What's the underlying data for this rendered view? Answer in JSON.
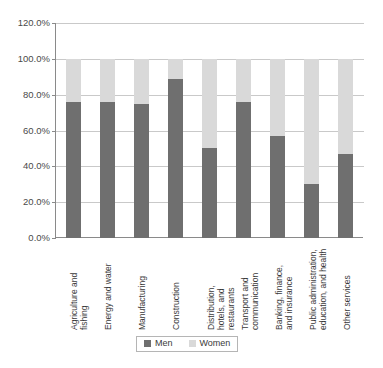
{
  "chart_data": {
    "type": "bar",
    "stacked": true,
    "orientation": "vertical",
    "title": "",
    "subtitle": "",
    "xlabel": "",
    "ylabel": "",
    "ylim": [
      0,
      120
    ],
    "ytick_step": 20,
    "ytick_labels": [
      "0.0%",
      "20.0%",
      "40.0%",
      "60.0%",
      "80.0%",
      "100.0%",
      "120.0%"
    ],
    "ytick_values": [
      0,
      20,
      40,
      60,
      80,
      100,
      120
    ],
    "grid": true,
    "grid_axis": "y",
    "legend_position": "bottom",
    "categories": [
      "Agriculture and fishing",
      "Energy and water",
      "Manufacturing",
      "Construction",
      "Distribution, hotels, and restaurants",
      "Transport and communication",
      "Banking, finance, and insurance",
      "Public administration, education, and health",
      "Other services"
    ],
    "category_label_lines": [
      "Agriculture and\nfishing",
      "Energy and water",
      "Manufacturing",
      "Construction",
      "Distribution,\nhotels, and\nrestaurants",
      "Transport and\ncommunication",
      "Banking, finance,\nand insurance",
      "Public administration,\neducation, and health",
      "Other services"
    ],
    "series": [
      {
        "name": "Men",
        "color": "#6f6f6f",
        "values": [
          76,
          76,
          75,
          89,
          50,
          76,
          57,
          30,
          47
        ]
      },
      {
        "name": "Women",
        "color": "#d9d9d9",
        "values": [
          24,
          24,
          25,
          11,
          50,
          24,
          43,
          70,
          53
        ]
      }
    ]
  },
  "legend": {
    "items": [
      {
        "label": "Men",
        "color": "#6f6f6f"
      },
      {
        "label": "Women",
        "color": "#d9d9d9"
      }
    ]
  },
  "colors": {
    "men": "#6f6f6f",
    "women": "#d9d9d9",
    "grid": "#c9c9c9",
    "axis": "#8a8a8a",
    "background": "#ffffff",
    "text": "#3a3a3a"
  }
}
